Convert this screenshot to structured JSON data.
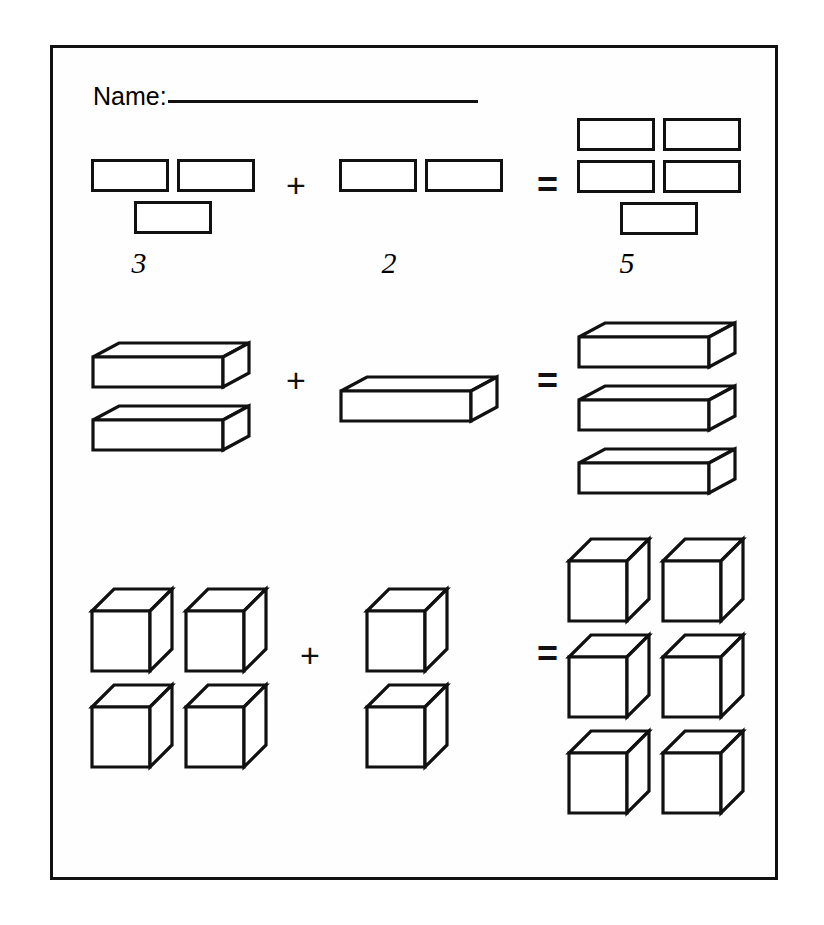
{
  "worksheet": {
    "name_label": "Name:",
    "name_value": "",
    "border_color": "#111111",
    "page_background": "#ffffff"
  },
  "symbols": {
    "plus": "+",
    "equals": "="
  },
  "problems": [
    {
      "id": "problem-1",
      "manipulative": "flat-rectangle",
      "addend_a": {
        "count": 3,
        "answer_text": "3",
        "filled": true
      },
      "addend_b": {
        "count": 2,
        "answer_text": "2",
        "filled": true
      },
      "sum": {
        "count": 5,
        "answer_text": "5",
        "filled": true
      }
    },
    {
      "id": "problem-2",
      "manipulative": "iso-bar",
      "addend_a": {
        "count": 2,
        "answer_text": "",
        "filled": false
      },
      "addend_b": {
        "count": 1,
        "answer_text": "",
        "filled": false
      },
      "sum": {
        "count": 3,
        "answer_text": "",
        "filled": false
      }
    },
    {
      "id": "problem-3",
      "manipulative": "iso-cube",
      "addend_a": {
        "count": 4,
        "answer_text": "",
        "filled": false
      },
      "addend_b": {
        "count": 2,
        "answer_text": "",
        "filled": false
      },
      "sum": {
        "count": 6,
        "answer_text": "",
        "filled": false
      }
    }
  ]
}
